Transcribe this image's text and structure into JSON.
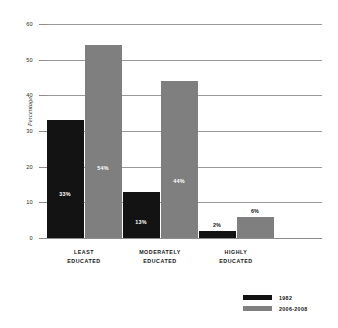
{
  "chart_data": {
    "type": "bar",
    "title": "",
    "xlabel": "",
    "ylabel": "Percentage",
    "ylim": [
      0,
      60
    ],
    "yticks": [
      0,
      10,
      20,
      30,
      40,
      50,
      60
    ],
    "ytick_labels": [
      "0",
      "10",
      "20",
      "30",
      "40",
      "50",
      "60"
    ],
    "grid": true,
    "legend_position": "bottom-right",
    "categories": [
      "LEAST EDUCATED",
      "MODERATELY EDUCATED",
      "HIGHLY EDUCATED"
    ],
    "category_lines": [
      [
        "LEAST",
        "EDUCATED"
      ],
      [
        "MODERATELY",
        "EDUCATED"
      ],
      [
        "HIGHLY",
        "EDUCATED"
      ]
    ],
    "series": [
      {
        "name": "1982",
        "color": "#131313",
        "values": [
          33,
          13,
          2
        ],
        "data_labels": [
          "33%",
          "13%",
          "2%"
        ]
      },
      {
        "name": "2006-2008",
        "color": "#7f7f7f",
        "values": [
          54,
          44,
          6
        ],
        "data_labels": [
          "54%",
          "44%",
          "6%"
        ]
      }
    ]
  },
  "legend": {
    "items": [
      {
        "label": "1982",
        "color": "#131313"
      },
      {
        "label": "2006-2008",
        "color": "#7f7f7f"
      }
    ]
  },
  "axis": {
    "y_title": "Percentage",
    "ticks": [
      "60",
      "50",
      "40",
      "30",
      "20",
      "10",
      "0"
    ]
  }
}
